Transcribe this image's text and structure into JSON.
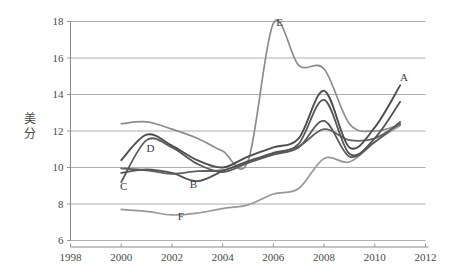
{
  "chart_data": {
    "type": "line",
    "title": "",
    "xlabel": "",
    "ylabel": "美分",
    "ylabel_chars": [
      "美",
      "分"
    ],
    "xlim": [
      1998,
      2012
    ],
    "ylim": [
      6,
      18
    ],
    "xticks": [
      1998,
      2000,
      2002,
      2004,
      2006,
      2008,
      2010,
      2012
    ],
    "yticks": [
      6,
      8,
      10,
      12,
      14,
      16,
      18
    ],
    "grid": "horizontal",
    "legend": "inline-labels",
    "x": [
      2000,
      2001,
      2002,
      2003,
      2004,
      2005,
      2006,
      2007,
      2008,
      2009,
      2010,
      2011
    ],
    "series": [
      {
        "name": "A",
        "label": "A",
        "color": "#4d4d4d",
        "width": 1.9,
        "label_x": 2011.15,
        "label_y": 14.75,
        "values": [
          10.4,
          11.8,
          11.2,
          10.4,
          10.0,
          10.6,
          11.1,
          11.6,
          14.2,
          11.1,
          12.2,
          14.5
        ]
      },
      {
        "name": "B",
        "label": "B",
        "color": "#555555",
        "width": 1.8,
        "label_x": 2002.85,
        "label_y": 8.85,
        "values": [
          9.7,
          9.9,
          9.7,
          9.25,
          9.8,
          10.35,
          10.8,
          11.3,
          13.7,
          10.75,
          11.6,
          13.6
        ]
      },
      {
        "name": "C",
        "label": "C",
        "color": "#5a5a5a",
        "width": 1.8,
        "label_x": 2000.1,
        "label_y": 8.75,
        "values": [
          9.2,
          11.5,
          11.1,
          10.2,
          9.75,
          10.25,
          10.7,
          11.1,
          12.55,
          10.6,
          11.4,
          12.5
        ]
      },
      {
        "name": "D",
        "label": "D",
        "color": "#606060",
        "width": 1.8,
        "label_x": 2001.15,
        "label_y": 10.85,
        "values": [
          9.95,
          9.85,
          9.65,
          9.8,
          9.85,
          10.3,
          10.75,
          11.15,
          12.1,
          11.5,
          11.6,
          12.4
        ]
      },
      {
        "name": "E",
        "label": "E",
        "color": "#8c8c8c",
        "width": 1.7,
        "label_x": 2006.25,
        "label_y": 17.75,
        "values": [
          12.4,
          12.5,
          12.1,
          11.6,
          10.9,
          10.35,
          17.9,
          15.6,
          15.4,
          12.4,
          12.0,
          12.35
        ]
      },
      {
        "name": "F",
        "label": "F",
        "color": "#989898",
        "width": 1.7,
        "label_x": 2002.35,
        "label_y": 7.1,
        "values": [
          7.7,
          7.6,
          7.4,
          7.5,
          7.75,
          7.95,
          8.55,
          8.85,
          10.5,
          10.3,
          11.4,
          12.3
        ]
      }
    ],
    "annotations": [
      {
        "text": "A",
        "x": 2011.15,
        "y": 14.75
      },
      {
        "text": "B",
        "x": 2002.85,
        "y": 8.85
      },
      {
        "text": "C",
        "x": 2000.1,
        "y": 8.75
      },
      {
        "text": "D",
        "x": 2001.15,
        "y": 10.85
      },
      {
        "text": "E",
        "x": 2006.25,
        "y": 17.75
      },
      {
        "text": "F",
        "x": 2002.35,
        "y": 7.1
      }
    ]
  },
  "colors": {
    "background": "#ffffff",
    "grid": "#9a9a9a",
    "axis": "#7d7d7d",
    "text": "#4a4a4a"
  }
}
